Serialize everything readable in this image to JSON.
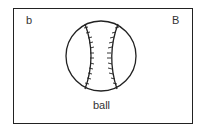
{
  "card": {
    "lowercase_letter": "b",
    "uppercase_letter": "B",
    "word": "ball",
    "image": "baseball-icon"
  }
}
